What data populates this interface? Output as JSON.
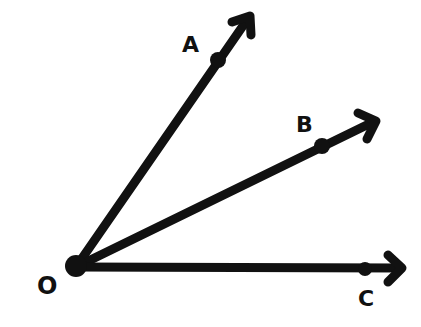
{
  "diagram": {
    "type": "rays-from-common-vertex",
    "vertex": {
      "label": "O",
      "x": 76,
      "y": 267
    },
    "rays": [
      {
        "name": "OA",
        "point_label": "A",
        "point": {
          "x": 218,
          "y": 60
        },
        "tip": {
          "x": 250,
          "y": 16
        }
      },
      {
        "name": "OB",
        "point_label": "B",
        "point": {
          "x": 322,
          "y": 146
        },
        "tip": {
          "x": 376,
          "y": 121
        }
      },
      {
        "name": "OC",
        "point_label": "C",
        "point": {
          "x": 365,
          "y": 269
        },
        "tip": {
          "x": 402,
          "y": 268
        }
      }
    ],
    "labels": {
      "O": "O",
      "A": "A",
      "B": "B",
      "C": "C"
    },
    "colors": {
      "ink": "#111111",
      "background": "#ffffff"
    }
  }
}
